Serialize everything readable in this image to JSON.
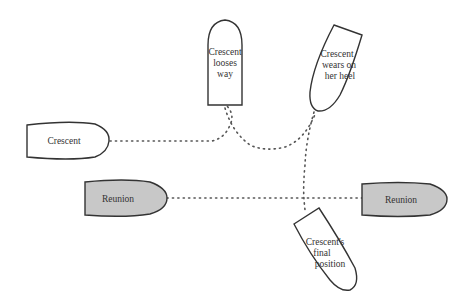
{
  "diagram": {
    "type": "vessel-manoeuvre",
    "colors": {
      "crescent_fill": "#ffffff",
      "reunion_fill": "#c8c8c8",
      "outline": "#333333",
      "track": "#555555"
    },
    "boats": [
      {
        "id": "crescent-start",
        "lines": [
          "Crescent"
        ]
      },
      {
        "id": "crescent-looses-way",
        "lines": [
          "Crescent",
          "looses",
          "way"
        ]
      },
      {
        "id": "crescent-wears",
        "lines": [
          "Crescent",
          "wears on",
          "her heel"
        ]
      },
      {
        "id": "reunion-left",
        "lines": [
          "Reunion"
        ]
      },
      {
        "id": "reunion-right",
        "lines": [
          "Reunion"
        ]
      },
      {
        "id": "crescent-final",
        "lines": [
          "Crescent's",
          "final",
          "position"
        ]
      }
    ]
  }
}
